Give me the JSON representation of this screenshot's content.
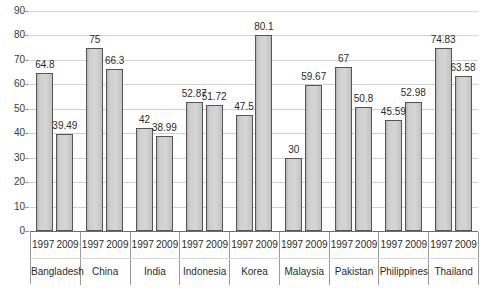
{
  "chart_data": {
    "type": "bar",
    "title": "",
    "subtitle": "",
    "xlabel": "",
    "ylabel": "",
    "ylim": [
      0,
      90
    ],
    "ytick_step": 10,
    "yticks": [
      "0",
      "10",
      "20",
      "30",
      "40",
      "50",
      "60",
      "70",
      "80",
      "90"
    ],
    "grid": true,
    "legend": "none",
    "categories": [
      "Bangladesh",
      "China",
      "India",
      "Indonesia",
      "Korea",
      "Malaysia",
      "Pakistan",
      "Philippines",
      "Thailand"
    ],
    "series": [
      {
        "name": "1997",
        "values": [
          64.8,
          75,
          42,
          52.87,
          47.5,
          30,
          67,
          45.59,
          74.83
        ],
        "labels": [
          "64.8",
          "75",
          "42",
          "52.87",
          "47.5",
          "30",
          "67",
          "45.59",
          "74.83"
        ]
      },
      {
        "name": "2009",
        "values": [
          39.49,
          66.3,
          38.99,
          51.72,
          80.1,
          59.67,
          50.8,
          52.98,
          63.58
        ],
        "labels": [
          "39.49",
          "66.3",
          "38.99",
          "51.72",
          "80.1",
          "59.67",
          "50.8",
          "52.98",
          "63.58"
        ]
      }
    ],
    "colors": {
      "bar_fill": "#d0d0d0",
      "bar_border": "#555555",
      "gridline": "#d2d2d2",
      "axis": "#6e6e6e",
      "text": "#2b2b2b",
      "background": "#ffffff"
    }
  }
}
